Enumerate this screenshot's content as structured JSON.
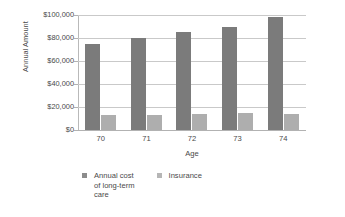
{
  "chart_data": {
    "type": "bar",
    "title": "",
    "xlabel": "Age",
    "ylabel": "Annual Amount",
    "categories": [
      "70",
      "71",
      "72",
      "73",
      "74"
    ],
    "series": [
      {
        "name": "Annual cost of long-term care",
        "color": "#7b7b7b",
        "values": [
          75000,
          80000,
          85000,
          90000,
          98000
        ]
      },
      {
        "name": "Insurance",
        "color": "#aeaeae",
        "values": [
          13000,
          13000,
          14000,
          14500,
          14000
        ]
      }
    ],
    "ylim": [
      0,
      100000
    ],
    "ytick_labels": [
      "$0",
      "$20,000",
      "$40,000",
      "$60,000",
      "$80,000",
      "$100,000"
    ],
    "ytick_values": [
      0,
      20000,
      40000,
      60000,
      80000,
      100000
    ],
    "grid": true,
    "legend_position": "bottom"
  },
  "legend": {
    "items": [
      {
        "label": "Annual cost\nof long-term\ncare",
        "color": "#8c8c8c"
      },
      {
        "label": "Insurance",
        "color": "#b6b6b6"
      }
    ]
  }
}
